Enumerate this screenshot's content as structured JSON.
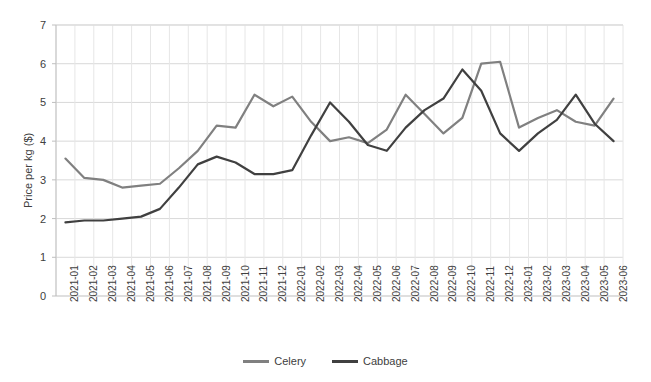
{
  "chart_data": {
    "type": "line",
    "title": "",
    "xlabel": "",
    "ylabel": "Price per kg ($)",
    "ylim": [
      0,
      7
    ],
    "yticks": [
      0,
      1,
      2,
      3,
      4,
      5,
      6,
      7
    ],
    "grid": true,
    "legend_position": "bottom",
    "categories": [
      "2021-01",
      "2021-02",
      "2021-03",
      "2021-04",
      "2021-05",
      "2021-06",
      "2021-07",
      "2021-08",
      "2021-09",
      "2021-10",
      "2021-11",
      "2021-12",
      "2022-01",
      "2022-02",
      "2022-03",
      "2022-04",
      "2022-05",
      "2022-06",
      "2022-07",
      "2022-08",
      "2022-09",
      "2022-10",
      "2022-11",
      "2022-12",
      "2023-01",
      "2023-02",
      "2023-03",
      "2023-04",
      "2023-05",
      "2023-06"
    ],
    "series": [
      {
        "name": "Celery",
        "color": "#808080",
        "values": [
          3.55,
          3.05,
          3.0,
          2.8,
          2.85,
          2.9,
          3.3,
          3.75,
          4.4,
          4.35,
          5.2,
          4.9,
          5.15,
          4.5,
          4.0,
          4.1,
          3.95,
          4.3,
          5.2,
          4.7,
          4.2,
          4.6,
          6.0,
          6.05,
          4.35,
          4.6,
          4.8,
          4.5,
          4.4,
          5.1
        ]
      },
      {
        "name": "Cabbage",
        "color": "#404040",
        "values": [
          1.9,
          1.95,
          1.95,
          2.0,
          2.05,
          2.25,
          2.8,
          3.4,
          3.6,
          3.45,
          3.15,
          3.15,
          3.25,
          4.15,
          5.0,
          4.5,
          3.9,
          3.75,
          4.35,
          4.8,
          5.1,
          5.85,
          5.3,
          4.2,
          3.75,
          4.2,
          4.55,
          5.2,
          4.45,
          4.0
        ]
      }
    ],
    "legend": [
      {
        "label": "Celery",
        "color": "#808080"
      },
      {
        "label": "Cabbage",
        "color": "#404040"
      }
    ]
  },
  "axis": {
    "plot_left": 56,
    "plot_right": 623,
    "plot_top": 25,
    "plot_bottom": 296
  }
}
